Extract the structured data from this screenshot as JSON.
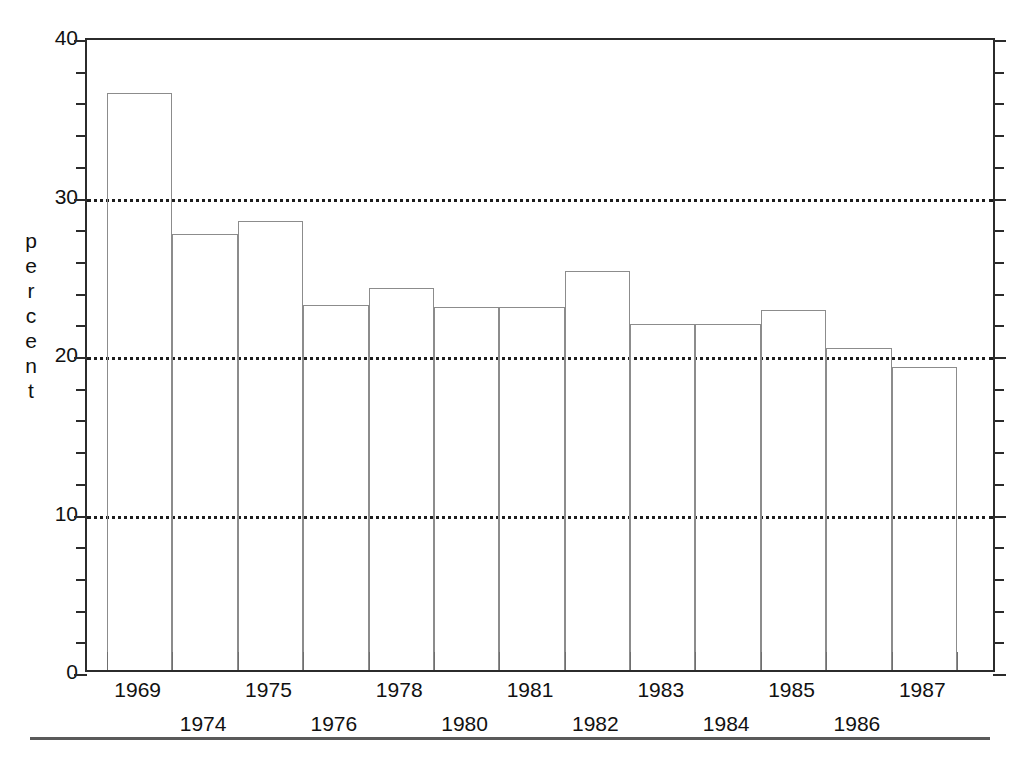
{
  "chart_data": {
    "type": "bar",
    "title": "",
    "xlabel": "",
    "ylabel": "percent",
    "ylim": [
      0,
      40
    ],
    "ytick_major": [
      0,
      10,
      20,
      30,
      40
    ],
    "ytick_major_labels": [
      "0",
      "10",
      "20",
      "30",
      "40"
    ],
    "ytick_minor_step": 2,
    "gridlines": [
      10,
      20,
      30
    ],
    "grid": "horizontal-dotted",
    "legend": "none",
    "bar_style": "outline-only",
    "categories": [
      "1969",
      "1974",
      "1975",
      "1976",
      "1978",
      "1980",
      "1981",
      "1982",
      "1983",
      "1984",
      "1985",
      "1986",
      "1987"
    ],
    "values": [
      36.4,
      27.5,
      28.3,
      23.0,
      24.1,
      22.9,
      22.9,
      25.2,
      21.8,
      21.8,
      22.7,
      20.3,
      19.1
    ],
    "xtick_label_rows": [
      0,
      1,
      0,
      1,
      0,
      1,
      0,
      1,
      0,
      1,
      0,
      1,
      0
    ],
    "colors": {
      "frame": "#2b2b2b",
      "bar_outline": "#8c8c8c",
      "gridline": "#1d1d1d",
      "text": "#111111",
      "rule": "#5a5a5a",
      "background": "#ffffff"
    }
  }
}
